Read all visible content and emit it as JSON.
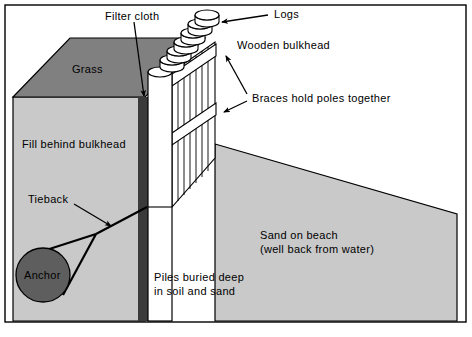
{
  "figure": {
    "type": "technical-cutaway-diagram"
  },
  "colors": {
    "grass": "#808080",
    "fill": "#c9c9c9",
    "sand": "#c9c9c9",
    "anchor": "#5e5e5e",
    "filter_cloth": "#3a3a3a",
    "pile_white": "#ffffff",
    "outline": "#000000",
    "background": "#ffffff"
  },
  "labels": {
    "filter_cloth": "Filter cloth",
    "logs": "Logs",
    "wooden_bulkhead": "Wooden bulkhead",
    "braces": "Braces hold poles together",
    "grass": "Grass",
    "fill_behind_bulkhead": "Fill behind bulkhead",
    "tieback": "Tieback",
    "anchor": "Anchor",
    "sand_line1": "Sand on beach",
    "sand_line2": "(well back from water)",
    "piles_line1": "Piles buried deep",
    "piles_line2": "in soil and sand"
  },
  "structure": {
    "log_count": 6,
    "brace_count": 2,
    "pole_count": 7,
    "border": "rectangular frame around entire figure"
  }
}
